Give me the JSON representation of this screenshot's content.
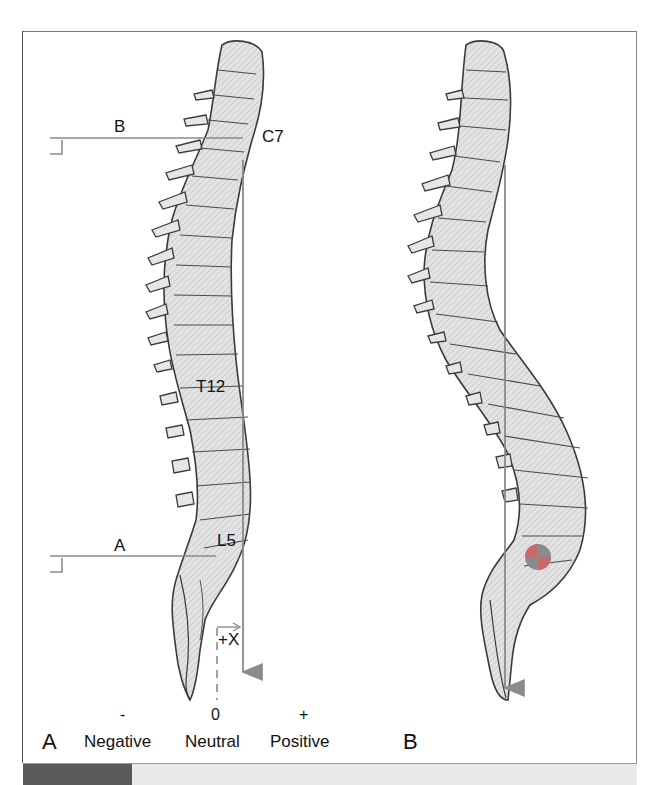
{
  "figure": {
    "panel_a": {
      "panel_label": "A",
      "vertebra_labels": {
        "c7": "C7",
        "t12": "T12",
        "l5": "L5"
      },
      "reference_lines": {
        "upper": "B",
        "lower": "A"
      },
      "offset_label": "+X",
      "scale": {
        "ticks": [
          {
            "symbol": "-",
            "label": "Negative"
          },
          {
            "symbol": "0",
            "label": "Neutral"
          },
          {
            "symbol": "+",
            "label": "Positive"
          }
        ]
      }
    },
    "panel_b": {
      "panel_label": "B"
    },
    "colors": {
      "plumb_line": "#8a8a8a",
      "reference_line": "#8a8a8a",
      "bone_fill": "#e4e4e4",
      "bone_outline": "#3a3a3a",
      "center_marker_red": "#c96a6a",
      "center_marker_gray": "#8a8a8a",
      "bottom_bar_dark": "#5b5b5b",
      "bottom_bar_light": "#e9e9e9"
    }
  }
}
